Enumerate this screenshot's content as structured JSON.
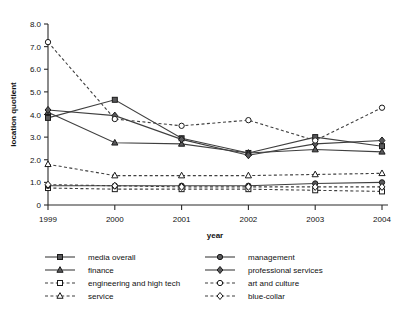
{
  "chart_data": {
    "type": "line",
    "title": "",
    "xlabel": "year",
    "ylabel": "location quotient",
    "categories": [
      "1999",
      "2000",
      "2001",
      "2002",
      "2003",
      "2004"
    ],
    "x": [
      1999,
      2000,
      2001,
      2002,
      2003,
      2004
    ],
    "xlim": [
      1999,
      2004
    ],
    "ylim": [
      0,
      8.0
    ],
    "yticks": [
      "0",
      "1.0",
      "2.0",
      "3.0",
      "4.0",
      "5.0",
      "6.0",
      "7.0",
      "8.0"
    ],
    "ytick_values": [
      0,
      1.0,
      2.0,
      3.0,
      4.0,
      5.0,
      6.0,
      7.0,
      8.0
    ],
    "grid": false,
    "legend_position": "bottom",
    "series": [
      {
        "name": "media overall",
        "marker": "square",
        "fill": "solid",
        "line": "solid",
        "values": [
          3.85,
          4.65,
          2.95,
          2.3,
          3.0,
          2.6
        ]
      },
      {
        "name": "finance",
        "marker": "triangle",
        "fill": "solid",
        "line": "solid",
        "values": [
          4.1,
          2.75,
          2.7,
          2.3,
          2.45,
          2.35
        ]
      },
      {
        "name": "engineering and high tech",
        "marker": "square",
        "fill": "open",
        "line": "dashed",
        "values": [
          0.75,
          0.7,
          0.7,
          0.7,
          0.65,
          0.6
        ]
      },
      {
        "name": "service",
        "marker": "triangle",
        "fill": "open",
        "line": "dashed",
        "values": [
          1.8,
          1.3,
          1.3,
          1.3,
          1.35,
          1.4
        ]
      },
      {
        "name": "management",
        "marker": "circle",
        "fill": "solid",
        "line": "solid",
        "values": [
          0.85,
          0.85,
          0.85,
          0.85,
          0.95,
          1.0
        ]
      },
      {
        "name": "professional services",
        "marker": "diamond",
        "fill": "solid",
        "line": "solid",
        "values": [
          4.2,
          3.95,
          2.9,
          2.2,
          2.7,
          2.85
        ]
      },
      {
        "name": "art and culture",
        "marker": "circle",
        "fill": "open",
        "line": "dashed",
        "values": [
          7.2,
          3.8,
          3.5,
          3.75,
          2.85,
          4.3
        ]
      },
      {
        "name": "blue-collar",
        "marker": "diamond",
        "fill": "open",
        "line": "dashed",
        "values": [
          0.9,
          0.85,
          0.8,
          0.8,
          0.8,
          0.8
        ]
      }
    ]
  },
  "legend": {
    "items": [
      {
        "label": "media overall"
      },
      {
        "label": "finance"
      },
      {
        "label": "engineering and high tech"
      },
      {
        "label": "service"
      },
      {
        "label": "management"
      },
      {
        "label": "professional services"
      },
      {
        "label": "art and culture"
      },
      {
        "label": "blue-collar"
      }
    ]
  },
  "colors": {
    "marker_fill": "#58585a",
    "marker_stroke": "#1a1a1a",
    "line": "#3f3f3f",
    "axis": "#2b2b2b",
    "text": "#111111",
    "background": "#ffffff"
  }
}
